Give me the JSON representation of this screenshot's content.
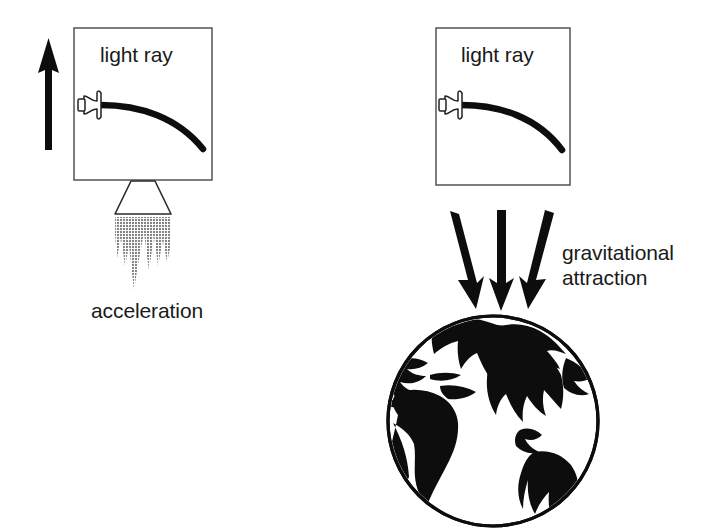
{
  "figure": {
    "title": "",
    "background_color": "#ffffff",
    "ink_color": "#000000",
    "box_stroke_color": "#5a5a5a",
    "flame_color": "#8c8c8c"
  },
  "left_panel": {
    "name": "accelerating-rocket-frame",
    "box_label": "light ray",
    "caption": "acceleration",
    "arrow_direction": "up",
    "icons": {
      "lamp": "flashlight-icon",
      "ray": "curved-light-ray-icon",
      "arrow": "up-arrow-icon",
      "nozzle": "rocket-nozzle-icon",
      "flame": "exhaust-flame-icon"
    }
  },
  "right_panel": {
    "name": "gravitational-field-frame",
    "box_label": "light ray",
    "caption_line1": "gravitational",
    "caption_line2": "attraction",
    "arrow_direction": "down",
    "arrow_count": 3,
    "icons": {
      "lamp": "flashlight-icon",
      "ray": "curved-light-ray-icon",
      "arrows": "down-arrow-icon",
      "planet": "globe-icon"
    }
  }
}
